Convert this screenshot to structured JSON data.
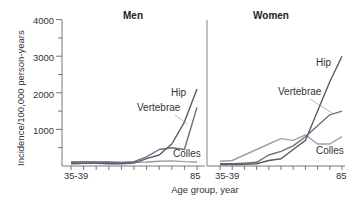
{
  "chart_data": [
    {
      "type": "line",
      "title": "Men",
      "xlabel": "Age group, year",
      "ylabel": "Incidence/100,000 person-years",
      "ylim": [
        0,
        4000
      ],
      "yticks": [
        1000,
        2000,
        3000,
        4000
      ],
      "x_tick_labels": [
        "35-39",
        "85"
      ],
      "categories": [
        "35-39",
        "40-44",
        "45-49",
        "50-54",
        "55-59",
        "60-64",
        "65-69",
        "70-74",
        "75-79",
        "80-84",
        "85+"
      ],
      "series": [
        {
          "name": "Hip",
          "color": "#5a5a6a",
          "values": [
            60,
            70,
            70,
            60,
            60,
            80,
            200,
            300,
            600,
            1200,
            2100
          ]
        },
        {
          "name": "Vertebrae",
          "color": "#6e6e7c",
          "values": [
            100,
            110,
            110,
            100,
            90,
            120,
            250,
            450,
            500,
            450,
            1600
          ]
        },
        {
          "name": "Colles",
          "color": "#9a9aa4",
          "values": [
            120,
            120,
            110,
            110,
            100,
            100,
            110,
            130,
            140,
            120,
            110
          ]
        }
      ],
      "grid": false
    },
    {
      "type": "line",
      "title": "Women",
      "xlabel": "Age group, year",
      "ylabel": "Incidence/100,000 person-years",
      "ylim": [
        0,
        4000
      ],
      "x_tick_labels": [
        "35-39",
        "85"
      ],
      "categories": [
        "35-39",
        "40-44",
        "45-49",
        "50-54",
        "55-59",
        "60-64",
        "65-69",
        "70-74",
        "75-79",
        "80-84",
        "85+"
      ],
      "series": [
        {
          "name": "Hip",
          "color": "#5a5a6a",
          "values": [
            40,
            40,
            50,
            60,
            150,
            200,
            450,
            700,
            1500,
            2300,
            3000
          ]
        },
        {
          "name": "Vertebrae",
          "color": "#6e6e7c",
          "values": [
            60,
            60,
            80,
            100,
            300,
            400,
            550,
            800,
            1100,
            1400,
            1500
          ]
        },
        {
          "name": "Colles",
          "color": "#a0a0aa",
          "values": [
            130,
            150,
            300,
            450,
            600,
            750,
            700,
            850,
            600,
            600,
            800
          ]
        }
      ],
      "grid": false
    }
  ],
  "labels": {
    "men_title": "Men",
    "women_title": "Women",
    "ylabel": "Incidence/100,000 person-years",
    "xlabel": "Age group, year",
    "yticks": [
      "4000",
      "3000",
      "2000",
      "1000"
    ],
    "x_first": "35-39",
    "x_last": "85",
    "men_hip": "Hip",
    "men_vertebrae": "Vertebrae",
    "men_colles": "Colles",
    "women_hip": "Hip",
    "women_vertebrae": "Vertebrae",
    "women_colles": "Colles"
  }
}
